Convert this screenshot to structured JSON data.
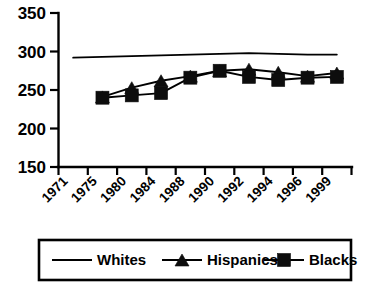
{
  "chart_data": {
    "type": "line",
    "title": "",
    "subtitle": "",
    "xlabel": "",
    "ylabel": "",
    "ylim": [
      150,
      350
    ],
    "yticks": [
      150,
      200,
      250,
      300,
      350
    ],
    "ytick_labels": [
      "150",
      "200",
      "250",
      "300",
      "350"
    ],
    "categories": [
      "1971",
      "1975",
      "1980",
      "1984",
      "1988",
      "1990",
      "1992",
      "1994",
      "1996",
      "1999"
    ],
    "grid": false,
    "legend_position": "bottom",
    "series": [
      {
        "name": "Whites",
        "marker": "none",
        "values": [
          292,
          293,
          294,
          295,
          296,
          297,
          298,
          297,
          296,
          296
        ]
      },
      {
        "name": "Hispanics",
        "marker": "triangle",
        "values": [
          null,
          241,
          253,
          262,
          268,
          275,
          277,
          273,
          268,
          272
        ]
      },
      {
        "name": "Blacks",
        "marker": "square",
        "values": [
          null,
          240,
          243,
          246,
          266,
          275,
          267,
          263,
          266,
          267
        ]
      }
    ],
    "legend": [
      {
        "label": "Whites",
        "marker": "none"
      },
      {
        "label": "Hispanics",
        "marker": "triangle"
      },
      {
        "label": "Blacks",
        "marker": "square"
      }
    ],
    "colors": {
      "axis": "#000000",
      "series": "#000000",
      "background": "#ffffff"
    }
  }
}
